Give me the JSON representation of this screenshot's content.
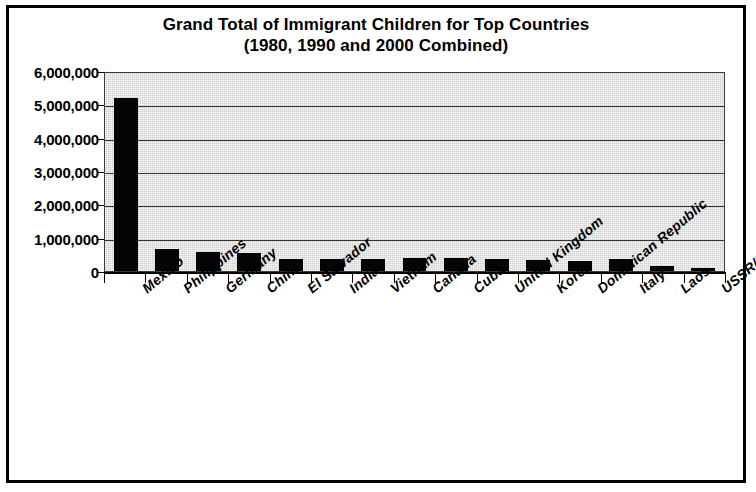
{
  "chart_data": {
    "type": "bar",
    "title": "Grand Total of Immigrant Children for Top Countries",
    "subtitle": "(1980, 1990 and 2000 Combined)",
    "xlabel": "",
    "ylabel": "",
    "ylim": [
      0,
      6000000
    ],
    "grid": true,
    "legend": "none",
    "orientation": "vertical",
    "bar_color": "#000000",
    "plot_background_color": "#cfcfcf",
    "y_ticks": [
      0,
      1000000,
      2000000,
      3000000,
      4000000,
      5000000,
      6000000
    ],
    "y_tick_labels": [
      "0",
      "1,000,000",
      "2,000,000",
      "3,000,000",
      "4,000,000",
      "5,000,000",
      "6,000,000"
    ],
    "categories": [
      "Mexico",
      "Philippines",
      "Germany",
      "China",
      "El Salvador",
      "India",
      "Vietnam",
      "Canada",
      "Cuba",
      "United Kingdom",
      "Korea",
      "Dominican Republic",
      "Italy",
      "Laos",
      "USSR/Russia"
    ],
    "values": [
      5200000,
      660000,
      570000,
      540000,
      360000,
      375000,
      360000,
      385000,
      385000,
      360000,
      330000,
      300000,
      350000,
      145000,
      95000
    ]
  }
}
